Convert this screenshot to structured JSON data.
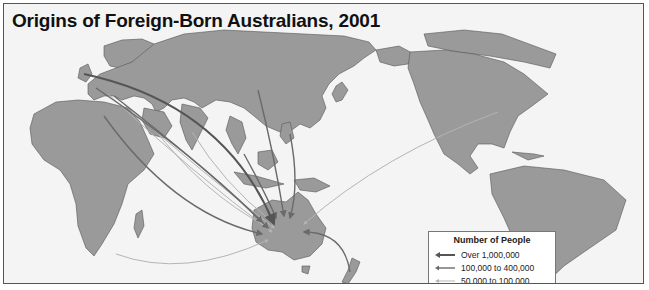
{
  "map": {
    "title": "Origins of Foreign-Born Australians, 2001",
    "projection": "Pacific-centered world map",
    "destination": "Australia",
    "colors": {
      "ocean": "#f4f4f4",
      "land": "#9a9a9a",
      "borders": "#555555",
      "over_1m": "#555555",
      "100k_400k": "#6a6a6a",
      "50k_100k": "#b4b4b4"
    },
    "legend": {
      "title": "Number of People",
      "items": [
        {
          "label": "Over 1,000,000",
          "class": "over_1m"
        },
        {
          "label": "100,000 to 400,000",
          "class": "100k_400k"
        },
        {
          "label": "50,000 to 100,000",
          "class": "50k_100k"
        }
      ]
    },
    "flows": [
      {
        "origin": "United Kingdom",
        "class": "over_1m"
      },
      {
        "origin": "Europe (continental)",
        "class": "100k_400k"
      },
      {
        "origin": "Europe (southern)",
        "class": "100k_400k"
      },
      {
        "origin": "Mediterranean / Southern Europe",
        "class": "100k_400k"
      },
      {
        "origin": "Middle East",
        "class": "50k_100k"
      },
      {
        "origin": "South Asia",
        "class": "50k_100k"
      },
      {
        "origin": "China",
        "class": "100k_400k"
      },
      {
        "origin": "Southeast Asia",
        "class": "100k_400k"
      },
      {
        "origin": "Philippines",
        "class": "50k_100k"
      },
      {
        "origin": "New Zealand",
        "class": "100k_400k"
      },
      {
        "origin": "North America",
        "class": "50k_100k"
      },
      {
        "origin": "Southern Africa",
        "class": "50k_100k"
      }
    ]
  }
}
